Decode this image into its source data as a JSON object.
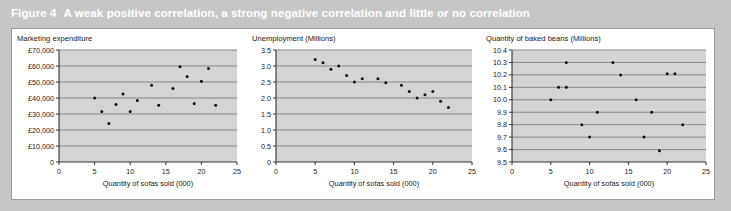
{
  "figure": {
    "number": "Figure 4",
    "caption": "A weak positive correlation, a strong negative correlation and little or no correlation",
    "caption_color": "#ffffff",
    "background_color": "#c6c6c6",
    "panel_color": "#ffffff",
    "plot_area_color": "#d4d4d4",
    "gridline_color": "#808080",
    "point_color": "#111111"
  },
  "chart_data": [
    {
      "type": "scatter",
      "title": "Marketing expenditure",
      "xlabel": "Quantity of sofas sold (000)",
      "ylabel": "Marketing expenditure",
      "correlation": "weak positive",
      "xlim": [
        0,
        25
      ],
      "ylim": [
        0,
        70000
      ],
      "grid": true,
      "legend": "none",
      "xticks": [
        0,
        5,
        10,
        15,
        20,
        25
      ],
      "xticklabels": [
        "0",
        "5",
        "10",
        "15",
        "20",
        "25"
      ],
      "yticks": [
        0,
        10000,
        20000,
        30000,
        40000,
        50000,
        60000,
        70000
      ],
      "yticklabels": [
        "0",
        "£10,000",
        "£20,000",
        "£30,000",
        "£40,000",
        "£50,000",
        "£60,000",
        "£70,000"
      ],
      "x": [
        5,
        6,
        7,
        8,
        9,
        10,
        11,
        13,
        14,
        16,
        17,
        18,
        19,
        20,
        21,
        22
      ],
      "y": [
        40000,
        31500,
        24000,
        36000,
        42500,
        31500,
        38500,
        48000,
        35500,
        46000,
        59500,
        53500,
        36500,
        50500,
        58500,
        35500
      ]
    },
    {
      "type": "scatter",
      "title": "Unemployment (Millions)",
      "xlabel": "Quantity of sofas sold (000)",
      "ylabel": "Unemployment (Millions)",
      "correlation": "strong negative",
      "xlim": [
        0,
        25
      ],
      "ylim": [
        0,
        3.5
      ],
      "grid": true,
      "legend": "none",
      "xticks": [
        0,
        5,
        10,
        15,
        20,
        25
      ],
      "xticklabels": [
        "0",
        "5",
        "10",
        "15",
        "20",
        "25"
      ],
      "yticks": [
        0,
        0.5,
        1.0,
        1.5,
        2.0,
        2.5,
        3.0,
        3.5
      ],
      "yticklabels": [
        "0",
        "0.5",
        "1.0",
        "1.5",
        "2.0",
        "2.5",
        "3.0",
        "3.5"
      ],
      "x": [
        5,
        6,
        7,
        8,
        9,
        10,
        11,
        13,
        14,
        16,
        17,
        18,
        19,
        20,
        21,
        22
      ],
      "y": [
        3.2,
        3.1,
        2.9,
        3.0,
        2.7,
        2.5,
        2.6,
        2.6,
        2.48,
        2.4,
        2.2,
        2.0,
        2.1,
        2.2,
        1.9,
        1.7
      ]
    },
    {
      "type": "scatter",
      "title": "Quantity of baked beans (Millions)",
      "xlabel": "Quantity of sofas sold (000)",
      "ylabel": "Quantity of baked beans (Millions)",
      "correlation": "little or none",
      "xlim": [
        0,
        25
      ],
      "ylim": [
        9.5,
        10.4
      ],
      "grid": true,
      "legend": "none",
      "xticks": [
        0,
        5,
        10,
        15,
        20,
        25
      ],
      "xticklabels": [
        "0",
        "5",
        "10",
        "15",
        "20",
        "25"
      ],
      "yticks": [
        9.5,
        9.6,
        9.7,
        9.8,
        9.9,
        10.0,
        10.1,
        10.2,
        10.3,
        10.4
      ],
      "yticklabels": [
        "9.5",
        "9.6",
        "9.7",
        "9.8",
        "9.9",
        "10.0",
        "10.1",
        "10.2",
        "10.3",
        "10.4"
      ],
      "x": [
        5,
        6,
        7,
        7,
        9,
        10,
        11,
        13,
        14,
        16,
        17,
        18,
        19,
        20,
        21,
        22
      ],
      "y": [
        10.0,
        10.1,
        10.3,
        10.1,
        9.8,
        9.7,
        9.9,
        10.3,
        10.2,
        10.0,
        9.7,
        9.9,
        9.59,
        10.21,
        10.21,
        9.8
      ]
    }
  ]
}
